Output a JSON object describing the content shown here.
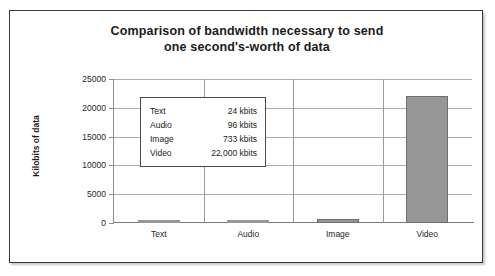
{
  "figure": {
    "title_line_1": "Comparison of bandwidth necessary to send",
    "title_line_2": "one second's-worth of data"
  },
  "chart_data": {
    "type": "bar",
    "title": "Comparison of bandwidth necessary to send one second's-worth of data",
    "xlabel": "",
    "ylabel": "Kilobits of data",
    "categories": [
      "Text",
      "Audio",
      "Image",
      "Video"
    ],
    "values": [
      24,
      96,
      733,
      22000
    ],
    "value_unit": "kbits",
    "ylim": [
      0,
      25000
    ],
    "yticks": [
      0,
      5000,
      10000,
      15000,
      20000,
      25000
    ],
    "ytick_labels": [
      "0",
      "5000",
      "10000",
      "15000",
      "20000",
      "25000"
    ],
    "grid": true,
    "legend": "none",
    "bar_color": "#969696",
    "bar_edge_color": "#6f6f6f",
    "annotation_table": {
      "rows": [
        {
          "label": "Text",
          "value": "24 kbits"
        },
        {
          "label": "Audio",
          "value": "96 kbits"
        },
        {
          "label": "Image",
          "value": "733 kbits"
        },
        {
          "label": "Video",
          "value": "22,000 kbits"
        }
      ]
    }
  }
}
